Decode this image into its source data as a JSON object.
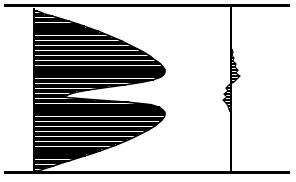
{
  "figure": {
    "title": "",
    "background": "#ffffff",
    "ink": "#000000",
    "width": 296,
    "height": 182
  },
  "chart_data": {
    "type": "bar",
    "orientation": "horizontal",
    "title": "",
    "xlabel": "",
    "ylabel": "",
    "grid": false,
    "legend": null,
    "annotations": [],
    "frame": {
      "top_rule_y": 5,
      "bottom_rule_y": 172,
      "rule_x_start": 4,
      "rule_x_end": 290,
      "rule_width": 3
    },
    "panels": [
      {
        "name": "primary-histogram",
        "axis_x": 34,
        "axis_y_top": 8,
        "axis_y_bottom": 172,
        "axis_width": 2,
        "direction": "right",
        "bar_pitch": 4.45,
        "bar_thickness": 2.1,
        "fill": "none",
        "edge": "#000000",
        "xlim": [
          0,
          132
        ],
        "ylim": [
          8,
          172
        ],
        "description": "bimodal horizontal histogram, two lobes separated by a narrow waist",
        "values": [
          4,
          10,
          19,
          28,
          36,
          44,
          51,
          58,
          65,
          71,
          77,
          83,
          89,
          94,
          99,
          104,
          109,
          113,
          117,
          120,
          124,
          127,
          129,
          131,
          131,
          130,
          127,
          120,
          108,
          92,
          74,
          56,
          42,
          34,
          30,
          60,
          95,
          118,
          126,
          129,
          131,
          131,
          130,
          128,
          125,
          122,
          118,
          114,
          109,
          104,
          99,
          93,
          87,
          81,
          74,
          67,
          60,
          52,
          44,
          36,
          28,
          20,
          12,
          5
        ]
      },
      {
        "name": "secondary-histogram",
        "axis_x": 231,
        "axis_y_top": 6,
        "axis_y_bottom": 172,
        "axis_width": 2,
        "direction": "bidirectional",
        "bar_pitch": 3.0,
        "bar_thickness": 1.6,
        "fill": "none",
        "edge": "#000000",
        "xlim": [
          -9,
          11
        ],
        "ylim": [
          48,
          114
        ],
        "description": "small noisy residual histogram straddling a second vertical axis",
        "points": [
          {
            "y": 49,
            "value": 1
          },
          {
            "y": 52,
            "value": 2
          },
          {
            "y": 55,
            "value": 1
          },
          {
            "y": 58,
            "value": 3
          },
          {
            "y": 61,
            "value": 2
          },
          {
            "y": 64,
            "value": 5
          },
          {
            "y": 67,
            "value": 4
          },
          {
            "y": 70,
            "value": 7
          },
          {
            "y": 73,
            "value": 5
          },
          {
            "y": 76,
            "value": 9
          },
          {
            "y": 79,
            "value": 6
          },
          {
            "y": 82,
            "value": 3
          },
          {
            "y": 85,
            "value": -2
          },
          {
            "y": 88,
            "value": -5
          },
          {
            "y": 91,
            "value": -3
          },
          {
            "y": 94,
            "value": -7
          },
          {
            "y": 97,
            "value": -4
          },
          {
            "y": 100,
            "value": -8
          },
          {
            "y": 103,
            "value": -5
          },
          {
            "y": 106,
            "value": -3
          },
          {
            "y": 109,
            "value": -2
          },
          {
            "y": 112,
            "value": -1
          }
        ]
      }
    ]
  }
}
